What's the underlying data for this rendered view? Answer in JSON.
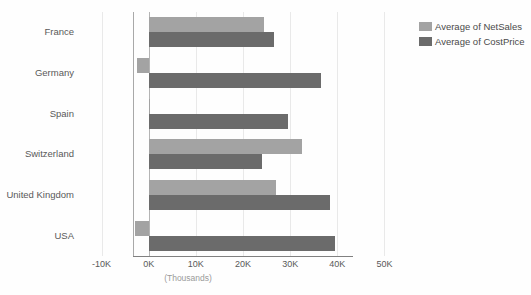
{
  "chart_data": {
    "type": "bar",
    "orientation": "horizontal",
    "title": "",
    "xlabel": "(Thousands)",
    "ylabel": "",
    "categories": [
      "France",
      "Germany",
      "Spain",
      "Switzerland",
      "United Kingdom",
      "USA"
    ],
    "series": [
      {
        "name": "Average of NetSales",
        "color": "#a3a3a3",
        "values": [
          24500,
          -2500,
          200,
          32500,
          27000,
          -3000
        ]
      },
      {
        "name": "Average of CostPrice",
        "color": "#6b6b6b",
        "values": [
          26500,
          36500,
          29500,
          24000,
          38500,
          39500
        ]
      }
    ],
    "xlim": [
      -15000,
      55000
    ],
    "xticks": [
      -10000,
      0,
      10000,
      20000,
      30000,
      40000,
      50000
    ],
    "xtick_labels": [
      "-10K",
      "0K",
      "10K",
      "20K",
      "30K",
      "40K",
      "50K"
    ],
    "grid": true,
    "legend_position": "right-top"
  },
  "legend": {
    "items": [
      {
        "label": "Average of NetSales",
        "color": "#a3a3a3"
      },
      {
        "label": "Average of CostPrice",
        "color": "#6b6b6b"
      }
    ]
  },
  "axis": {
    "x_title": "(Thousands)"
  },
  "colors": {
    "net_sales": "#a3a3a3",
    "cost_price": "#6b6b6b",
    "gridline": "#e9e9e9",
    "axis": "#a9a9a9",
    "text": "#595959",
    "background": "#fefefe"
  }
}
